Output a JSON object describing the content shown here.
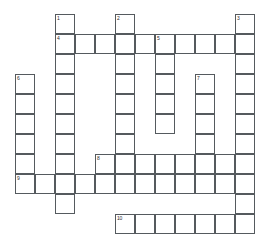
{
  "puzzle": {
    "title": "Crossword Puzzle Grid",
    "grid": {
      "cell_size": 20,
      "origin_x": 15,
      "origin_y": 14,
      "columns": 13,
      "rows": 12,
      "background_color": "#ffffff",
      "cell_border_color": "#555a5e",
      "cell_fill_color": "#ffffff",
      "number_color": "#2b2b2b"
    },
    "clue_numbers": [
      {
        "number": "1",
        "col": 2,
        "row": 0,
        "direction": "down",
        "length": 11
      },
      {
        "number": "2",
        "col": 5,
        "row": 0,
        "direction": "down",
        "length": 10
      },
      {
        "number": "3",
        "col": 11,
        "row": 0,
        "direction": "down",
        "length": 10
      },
      {
        "number": "4",
        "col": 2,
        "row": 1,
        "direction": "across",
        "length": 9
      },
      {
        "number": "5",
        "col": 7,
        "row": 1,
        "direction": "down",
        "length": 5
      },
      {
        "number": "6",
        "col": 0,
        "row": 3,
        "direction": "down",
        "length": 6
      },
      {
        "number": "7",
        "col": 9,
        "row": 3,
        "direction": "down",
        "length": 6
      },
      {
        "number": "8",
        "col": 4,
        "row": 7,
        "direction": "across",
        "length": 8
      },
      {
        "number": "9",
        "col": 0,
        "row": 8,
        "direction": "across",
        "length": 12
      },
      {
        "number": "10",
        "col": 5,
        "row": 10,
        "direction": "across",
        "length": 7
      }
    ],
    "cells": [
      {
        "col": 2,
        "row": 0,
        "number": "1",
        "letter": ""
      },
      {
        "col": 5,
        "row": 0,
        "number": "2",
        "letter": ""
      },
      {
        "col": 11,
        "row": 0,
        "number": "3",
        "letter": ""
      },
      {
        "col": 2,
        "row": 1,
        "number": "4",
        "letter": ""
      },
      {
        "col": 3,
        "row": 1,
        "number": "",
        "letter": ""
      },
      {
        "col": 4,
        "row": 1,
        "number": "",
        "letter": ""
      },
      {
        "col": 5,
        "row": 1,
        "number": "",
        "letter": ""
      },
      {
        "col": 6,
        "row": 1,
        "number": "",
        "letter": ""
      },
      {
        "col": 7,
        "row": 1,
        "number": "5",
        "letter": ""
      },
      {
        "col": 8,
        "row": 1,
        "number": "",
        "letter": ""
      },
      {
        "col": 9,
        "row": 1,
        "number": "",
        "letter": ""
      },
      {
        "col": 10,
        "row": 1,
        "number": "",
        "letter": ""
      },
      {
        "col": 11,
        "row": 1,
        "number": "",
        "letter": ""
      },
      {
        "col": 2,
        "row": 2,
        "number": "",
        "letter": ""
      },
      {
        "col": 5,
        "row": 2,
        "number": "",
        "letter": ""
      },
      {
        "col": 7,
        "row": 2,
        "number": "",
        "letter": ""
      },
      {
        "col": 11,
        "row": 2,
        "number": "",
        "letter": ""
      },
      {
        "col": 0,
        "row": 3,
        "number": "6",
        "letter": ""
      },
      {
        "col": 2,
        "row": 3,
        "number": "",
        "letter": ""
      },
      {
        "col": 5,
        "row": 3,
        "number": "",
        "letter": ""
      },
      {
        "col": 7,
        "row": 3,
        "number": "",
        "letter": ""
      },
      {
        "col": 9,
        "row": 3,
        "number": "7",
        "letter": ""
      },
      {
        "col": 11,
        "row": 3,
        "number": "",
        "letter": ""
      },
      {
        "col": 0,
        "row": 4,
        "number": "",
        "letter": ""
      },
      {
        "col": 2,
        "row": 4,
        "number": "",
        "letter": ""
      },
      {
        "col": 5,
        "row": 4,
        "number": "",
        "letter": ""
      },
      {
        "col": 7,
        "row": 4,
        "number": "",
        "letter": ""
      },
      {
        "col": 9,
        "row": 4,
        "number": "",
        "letter": ""
      },
      {
        "col": 11,
        "row": 4,
        "number": "",
        "letter": ""
      },
      {
        "col": 0,
        "row": 5,
        "number": "",
        "letter": ""
      },
      {
        "col": 2,
        "row": 5,
        "number": "",
        "letter": ""
      },
      {
        "col": 5,
        "row": 5,
        "number": "",
        "letter": ""
      },
      {
        "col": 7,
        "row": 5,
        "number": "",
        "letter": ""
      },
      {
        "col": 9,
        "row": 5,
        "number": "",
        "letter": ""
      },
      {
        "col": 11,
        "row": 5,
        "number": "",
        "letter": ""
      },
      {
        "col": 0,
        "row": 6,
        "number": "",
        "letter": ""
      },
      {
        "col": 2,
        "row": 6,
        "number": "",
        "letter": ""
      },
      {
        "col": 5,
        "row": 6,
        "number": "",
        "letter": ""
      },
      {
        "col": 9,
        "row": 6,
        "number": "",
        "letter": ""
      },
      {
        "col": 11,
        "row": 6,
        "number": "",
        "letter": ""
      },
      {
        "col": 0,
        "row": 7,
        "number": "",
        "letter": ""
      },
      {
        "col": 2,
        "row": 7,
        "number": "",
        "letter": ""
      },
      {
        "col": 4,
        "row": 7,
        "number": "8",
        "letter": ""
      },
      {
        "col": 5,
        "row": 7,
        "number": "",
        "letter": ""
      },
      {
        "col": 6,
        "row": 7,
        "number": "",
        "letter": ""
      },
      {
        "col": 7,
        "row": 7,
        "number": "",
        "letter": ""
      },
      {
        "col": 8,
        "row": 7,
        "number": "",
        "letter": ""
      },
      {
        "col": 9,
        "row": 7,
        "number": "",
        "letter": ""
      },
      {
        "col": 10,
        "row": 7,
        "number": "",
        "letter": ""
      },
      {
        "col": 11,
        "row": 7,
        "number": "",
        "letter": ""
      },
      {
        "col": 0,
        "row": 8,
        "number": "9",
        "letter": ""
      },
      {
        "col": 1,
        "row": 8,
        "number": "",
        "letter": ""
      },
      {
        "col": 2,
        "row": 8,
        "number": "",
        "letter": ""
      },
      {
        "col": 3,
        "row": 8,
        "number": "",
        "letter": ""
      },
      {
        "col": 4,
        "row": 8,
        "number": "",
        "letter": ""
      },
      {
        "col": 5,
        "row": 8,
        "number": "",
        "letter": ""
      },
      {
        "col": 6,
        "row": 8,
        "number": "",
        "letter": ""
      },
      {
        "col": 7,
        "row": 8,
        "number": "",
        "letter": ""
      },
      {
        "col": 8,
        "row": 8,
        "number": "",
        "letter": ""
      },
      {
        "col": 9,
        "row": 8,
        "number": "",
        "letter": ""
      },
      {
        "col": 10,
        "row": 8,
        "number": "",
        "letter": ""
      },
      {
        "col": 11,
        "row": 8,
        "number": "",
        "letter": ""
      },
      {
        "col": 2,
        "row": 9,
        "number": "",
        "letter": ""
      },
      {
        "col": 11,
        "row": 9,
        "number": "",
        "letter": ""
      },
      {
        "col": 5,
        "row": 10,
        "number": "10",
        "letter": ""
      },
      {
        "col": 6,
        "row": 10,
        "number": "",
        "letter": ""
      },
      {
        "col": 7,
        "row": 10,
        "number": "",
        "letter": ""
      },
      {
        "col": 8,
        "row": 10,
        "number": "",
        "letter": ""
      },
      {
        "col": 9,
        "row": 10,
        "number": "",
        "letter": ""
      },
      {
        "col": 10,
        "row": 10,
        "number": "",
        "letter": ""
      },
      {
        "col": 11,
        "row": 10,
        "number": "",
        "letter": ""
      }
    ]
  }
}
